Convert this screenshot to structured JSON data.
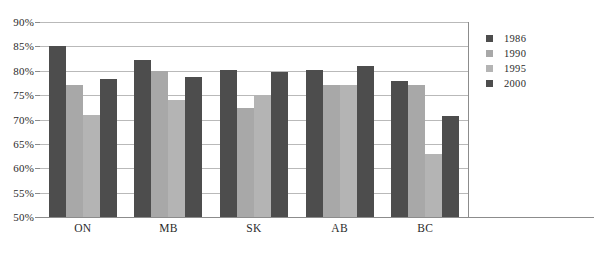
{
  "chart_data": {
    "type": "bar",
    "title": "",
    "subtitle": "",
    "xlabel": "",
    "ylabel": "",
    "categories": [
      "ON",
      "MB",
      "SK",
      "AB",
      "BC"
    ],
    "series": [
      {
        "name": "1986",
        "color": "#4d4d4d",
        "values": [
          85.0,
          82.2,
          80.2,
          80.2,
          78.0
        ]
      },
      {
        "name": "1990",
        "color": "#a8a8a8",
        "values": [
          77.0,
          80.0,
          72.3,
          77.0,
          77.0
        ]
      },
      {
        "name": "1995",
        "color": "#b4b4b4",
        "values": [
          71.0,
          74.0,
          75.0,
          77.0,
          63.0
        ]
      },
      {
        "name": "2000",
        "color": "#4d4d4d",
        "values": [
          78.3,
          78.7,
          79.8,
          81.0,
          70.8
        ]
      }
    ],
    "ylim": [
      50,
      90
    ],
    "ytick_values": [
      90,
      85,
      80,
      75,
      70,
      65,
      60,
      55,
      50
    ],
    "ytick_labels": [
      "90%",
      "85%",
      "80%",
      "75%",
      "70%",
      "65%",
      "60%",
      "55%",
      "50%"
    ],
    "grid": true,
    "legend_position": "right",
    "legend_entries": [
      "1986",
      "1990",
      "1995",
      "2000"
    ]
  }
}
